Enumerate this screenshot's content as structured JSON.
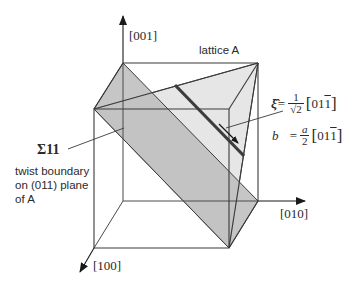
{
  "figure": {
    "axes": {
      "z_label": "[001]",
      "y_label": "[010]",
      "x_label": "[100]"
    },
    "lattice_label": "lattice A",
    "sigma_label": "Σ11",
    "boundary_description": {
      "line1": "twist boundary",
      "line2": "on (011) plane",
      "line3": "of  A"
    },
    "xi_formula": {
      "symbol": "ξ̂",
      "equals": "=",
      "numerator": "1",
      "denominator": "√2",
      "open": "[",
      "digits_plain": "01",
      "digit_bar": "1",
      "close": "]"
    },
    "b_formula": {
      "symbol": "b⃗",
      "equals": "=",
      "numerator": "a",
      "denominator": "2",
      "open": "[",
      "digits_plain": "01",
      "digit_bar": "1",
      "close": "]"
    },
    "colors": {
      "edge": "#3a3a3a",
      "dark_plane": "#b5b5b5",
      "light_plane": "#e3e3e3",
      "dislocation_line": "#3c3c3c"
    }
  }
}
